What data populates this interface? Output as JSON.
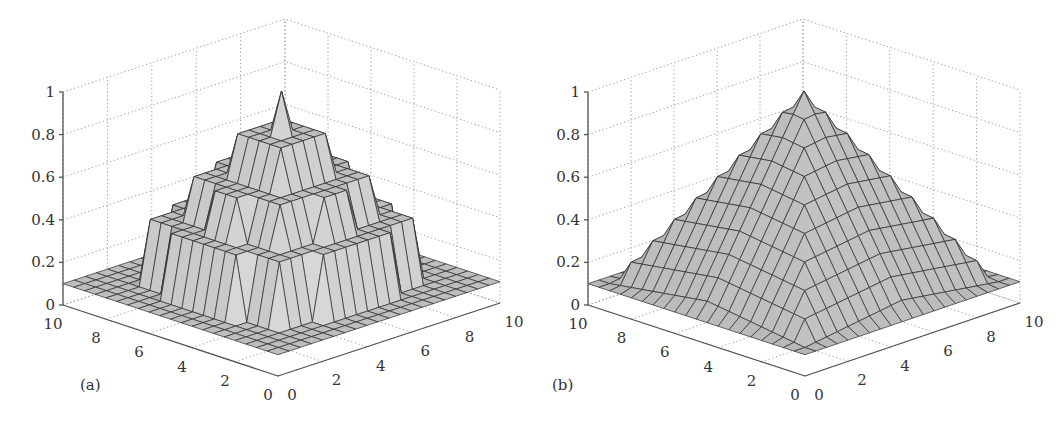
{
  "figure": {
    "panels": [
      {
        "id": "a",
        "label": "(a)"
      },
      {
        "id": "b",
        "label": "(b)"
      }
    ]
  },
  "chart_data": [
    {
      "type": "surface3d",
      "panel_label": "(a)",
      "title": "",
      "xlabel": "",
      "ylabel": "",
      "zlabel": "",
      "x_ticks": [
        "0",
        "2",
        "4",
        "6",
        "8",
        "10"
      ],
      "y_ticks": [
        "0",
        "2",
        "4",
        "6",
        "8",
        "10"
      ],
      "z_ticks": [
        "0",
        "0.2",
        "0.4",
        "0.6",
        "0.8",
        "1"
      ],
      "xlim": [
        0,
        10
      ],
      "ylim": [
        0,
        10
      ],
      "zlim": [
        0,
        1
      ],
      "grid": true,
      "description": "Stepped (quantized) pyramid-like surface peaking at 1 at center (5,5), with terraced plateaus near 0.8, 0.6 and 0.4; corners at about 0.1",
      "surface": "stepped",
      "peak": 1.0,
      "corner_value": 0.1,
      "levels": [
        0.1,
        0.4,
        0.6,
        0.8,
        1.0
      ]
    },
    {
      "type": "surface3d",
      "panel_label": "(b)",
      "title": "",
      "xlabel": "",
      "ylabel": "",
      "zlabel": "",
      "x_ticks": [
        "0",
        "2",
        "4",
        "6",
        "8",
        "10"
      ],
      "y_ticks": [
        "0",
        "2",
        "4",
        "6",
        "8",
        "10"
      ],
      "z_ticks": [
        "0",
        "0.2",
        "0.4",
        "0.6",
        "0.8",
        "1"
      ],
      "xlim": [
        0,
        10
      ],
      "ylim": [
        0,
        10
      ],
      "zlim": [
        0,
        1
      ],
      "grid": true,
      "description": "Smooth pyramid surface peaking at 1 at center (5,5), decreasing linearly toward edges; corners at about 0.1",
      "surface": "smooth",
      "peak": 1.0,
      "corner_value": 0.1
    }
  ]
}
